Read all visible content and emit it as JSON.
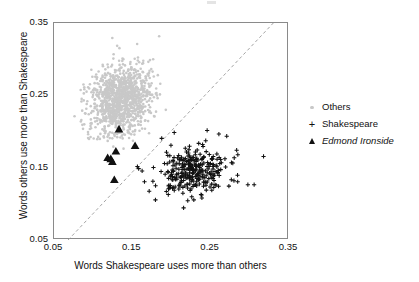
{
  "figure": {
    "width": 419,
    "height": 282,
    "background": "#ffffff"
  },
  "axes": {
    "x_label": "Words Shakespeare uses more than others",
    "y_label": "Words others use more than Shakespeare",
    "x_ticks": [
      "0.05",
      "0.15",
      "0.25",
      "0.35"
    ],
    "y_ticks": [
      "0.05",
      "0.15",
      "0.25",
      "0.35"
    ],
    "x_tick_values": [
      0.05,
      0.15,
      0.25,
      0.35
    ],
    "y_tick_values": [
      0.05,
      0.15,
      0.25,
      0.35
    ],
    "xlim": [
      0.05,
      0.35
    ],
    "ylim": [
      0.05,
      0.35
    ],
    "grid": false,
    "frame_color": "#8a8a8a"
  },
  "legend": {
    "position": "right",
    "items": [
      {
        "label": "Others",
        "marker": "dot",
        "color": "#c8c8c8",
        "italic": false
      },
      {
        "label": "Shakespeare",
        "marker": "plus",
        "color": "#111111",
        "italic": false
      },
      {
        "label": "Edmond Ironside",
        "marker": "triangle",
        "color": "#111111",
        "italic": true
      }
    ]
  },
  "chart_data": {
    "type": "scatter",
    "title": "",
    "xlabel": "Words Shakespeare uses more than others",
    "ylabel": "Words others use more than Shakespeare",
    "xlim": [
      0.05,
      0.35
    ],
    "ylim": [
      0.05,
      0.35
    ],
    "grid": false,
    "legend_position": "right",
    "reference_line": {
      "kind": "identity-dashed",
      "label": "y = x",
      "style": "dashed",
      "color": "#9a9a9a",
      "x": [
        0.068,
        0.33
      ],
      "y": [
        0.05,
        0.35
      ]
    },
    "series": [
      {
        "name": "Others",
        "marker": "dot",
        "color": "#c8c8c8",
        "size": 2.6,
        "n_points": 1150,
        "cluster": {
          "center_x": 0.136,
          "center_y": 0.244,
          "sd_x": 0.0195,
          "sd_y": 0.0245,
          "correlation": 0.18,
          "seed": 1731
        }
      },
      {
        "name": "Shakespeare",
        "marker": "plus",
        "color": "#111111",
        "size": 4.2,
        "n_points": 285,
        "cluster": {
          "center_x": 0.2265,
          "center_y": 0.1455,
          "sd_x": 0.0215,
          "sd_y": 0.0152,
          "correlation": 0.12,
          "seed": 907
        },
        "outliers": [
          {
            "x": 0.3175,
            "y": 0.1655
          },
          {
            "x": 0.2975,
            "y": 0.1265
          },
          {
            "x": 0.3055,
            "y": 0.1265
          },
          {
            "x": 0.2845,
            "y": 0.1305
          },
          {
            "x": 0.1715,
            "y": 0.1175
          },
          {
            "x": 0.1795,
            "y": 0.1055
          },
          {
            "x": 0.1655,
            "y": 0.1305
          },
          {
            "x": 0.1625,
            "y": 0.1455
          },
          {
            "x": 0.1565,
            "y": 0.1515
          },
          {
            "x": 0.1875,
            "y": 0.1905
          },
          {
            "x": 0.2035,
            "y": 0.1985
          },
          {
            "x": 0.2455,
            "y": 0.2015
          },
          {
            "x": 0.2605,
            "y": 0.1965
          },
          {
            "x": 0.2705,
            "y": 0.1935
          },
          {
            "x": 0.2285,
            "y": 0.1055
          }
        ]
      },
      {
        "name": "Edmond Ironside",
        "marker": "triangle",
        "color": "#111111",
        "size": 7.5,
        "n_points": 7,
        "points": [
          {
            "x": 0.133,
            "y": 0.203
          },
          {
            "x": 0.1535,
            "y": 0.18
          },
          {
            "x": 0.129,
            "y": 0.1725
          },
          {
            "x": 0.1185,
            "y": 0.1635
          },
          {
            "x": 0.1245,
            "y": 0.158
          },
          {
            "x": 0.1225,
            "y": 0.162
          },
          {
            "x": 0.127,
            "y": 0.133
          }
        ]
      }
    ]
  }
}
